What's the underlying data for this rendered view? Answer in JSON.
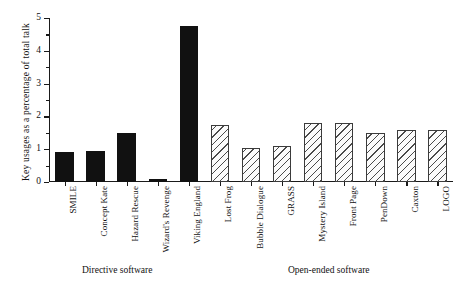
{
  "chart_data": {
    "type": "bar",
    "title": "",
    "xlabel": "",
    "ylabel": "Key usages as a percentage of total talk",
    "ylim": [
      0,
      5
    ],
    "ytick_labels": [
      "0",
      "1",
      "2",
      "3",
      "4",
      "5"
    ],
    "ytick_values": [
      0,
      1,
      2,
      3,
      4,
      5
    ],
    "yminor_values": [
      0.5,
      1.5,
      2.5,
      3.5,
      4.5
    ],
    "grid": false,
    "legend": "none",
    "categories": [
      "SMILE",
      "Concept Kate",
      "Hazard Rescue",
      "Wizard's Revenge",
      "Viking England",
      "Lost Frog",
      "Bubble Dialogue",
      "GRASS",
      "Mystery Island",
      "Front Page",
      "PenDown",
      "Caxton",
      "LOGO"
    ],
    "values": [
      0.9,
      0.95,
      1.5,
      0.1,
      4.75,
      1.75,
      1.05,
      1.1,
      1.8,
      1.8,
      1.5,
      1.6,
      1.6
    ],
    "fills": [
      "solid",
      "solid",
      "solid",
      "solid",
      "solid",
      "hatch",
      "hatch",
      "hatch",
      "hatch",
      "hatch",
      "hatch",
      "hatch",
      "hatch"
    ],
    "groups": [
      {
        "label": "Directive software",
        "members": [
          "SMILE",
          "Concept Kate",
          "Hazard Rescue",
          "Wizard's Revenge",
          "Viking England"
        ]
      },
      {
        "label": "Open-ended software",
        "members": [
          "Lost Frog",
          "Bubble Dialogue",
          "GRASS",
          "Mystery Island",
          "Front Page",
          "PenDown",
          "Caxton",
          "LOGO"
        ]
      }
    ],
    "colors": {
      "solid_fill": "#111111",
      "hatch_line": "#4a4a4a",
      "hatch_bg": "#fbfbfb",
      "axis": "#1a1a1a",
      "background": "#ffffff"
    }
  }
}
